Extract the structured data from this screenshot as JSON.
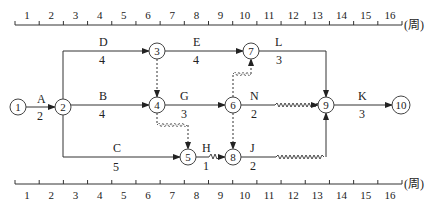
{
  "diagram": {
    "type": "time-scaled network diagram",
    "unit_label": "(周)",
    "scale_ticks": [
      "1",
      "2",
      "3",
      "4",
      "5",
      "6",
      "7",
      "8",
      "9",
      "10",
      "11",
      "12",
      "13",
      "14",
      "15",
      "16"
    ],
    "nodes": [
      {
        "id": "1",
        "label": "1"
      },
      {
        "id": "2",
        "label": "2"
      },
      {
        "id": "3",
        "label": "3"
      },
      {
        "id": "4",
        "label": "4"
      },
      {
        "id": "5",
        "label": "5"
      },
      {
        "id": "6",
        "label": "6"
      },
      {
        "id": "7",
        "label": "7"
      },
      {
        "id": "8",
        "label": "8"
      },
      {
        "id": "9",
        "label": "9"
      },
      {
        "id": "10",
        "label": "10"
      }
    ],
    "activities": [
      {
        "name": "A",
        "duration": "2",
        "from": "1",
        "to": "2"
      },
      {
        "name": "B",
        "duration": "4",
        "from": "2",
        "to": "4"
      },
      {
        "name": "C",
        "duration": "5",
        "from": "2",
        "to": "5"
      },
      {
        "name": "D",
        "duration": "4",
        "from": "2",
        "to": "3"
      },
      {
        "name": "E",
        "duration": "4",
        "from": "3",
        "to": "7"
      },
      {
        "name": "G",
        "duration": "3",
        "from": "4",
        "to": "6"
      },
      {
        "name": "H",
        "duration": "1",
        "from": "5",
        "to": "8"
      },
      {
        "name": "J",
        "duration": "2",
        "from": "8",
        "to": "9"
      },
      {
        "name": "K",
        "duration": "3",
        "from": "9",
        "to": "10"
      },
      {
        "name": "L",
        "duration": "3",
        "from": "7",
        "to": "9"
      },
      {
        "name": "N",
        "duration": "2",
        "from": "6",
        "to": "9"
      }
    ],
    "dummy_activities": [
      {
        "from": "3",
        "to": "4"
      },
      {
        "from": "4",
        "to": "5"
      },
      {
        "from": "6",
        "to": "7"
      },
      {
        "from": "6",
        "to": "8"
      }
    ]
  }
}
